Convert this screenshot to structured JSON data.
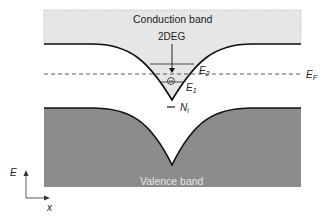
{
  "diagram": {
    "conduction_band_label": "Conduction band",
    "valence_band_label": "Valence band",
    "twodeg_label": "2DEG",
    "e2_label": {
      "main": "E",
      "sub": "2"
    },
    "e1_label": {
      "main": "E",
      "sub": "1"
    },
    "ef_label": {
      "main": "E",
      "sub": "F"
    },
    "ni_label": {
      "main": "N",
      "sub": "i"
    },
    "axis": {
      "y_label": "E",
      "x_label": "x"
    },
    "electron_symbol": "−",
    "colors": {
      "conduction_fill": "#e6e6e6",
      "valence_fill": "#8c8c8c",
      "line": "#111111"
    }
  }
}
